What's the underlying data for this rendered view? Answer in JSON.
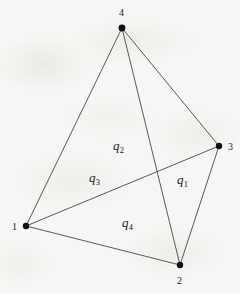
{
  "figure": {
    "kind": "graph-diagram",
    "width": 240,
    "height": 293,
    "background_color": "#f6f6f4",
    "line_color": "#3c3c3c",
    "node_color": "#101010",
    "text_color": "#1b1b1b"
  },
  "nodes": [
    {
      "id": "1",
      "label": "1",
      "x": 26,
      "y": 226,
      "r": 3.2,
      "label_x": 12,
      "label_y": 222
    },
    {
      "id": "2",
      "label": "2",
      "x": 180,
      "y": 265,
      "r": 3.2,
      "label_x": 177,
      "label_y": 276
    },
    {
      "id": "3",
      "label": "3",
      "x": 219,
      "y": 146,
      "r": 3.2,
      "label_x": 228,
      "label_y": 142
    },
    {
      "id": "4",
      "label": "4",
      "x": 122,
      "y": 28,
      "r": 3.4,
      "label_x": 119,
      "label_y": 8
    }
  ],
  "edges": [
    {
      "id": "e-1-4",
      "from": "1",
      "to": "4"
    },
    {
      "id": "e-1-3",
      "from": "1",
      "to": "3"
    },
    {
      "id": "e-1-2",
      "from": "1",
      "to": "2"
    },
    {
      "id": "e-4-3",
      "from": "4",
      "to": "3"
    },
    {
      "id": "e-4-2",
      "from": "4",
      "to": "2"
    },
    {
      "id": "e-3-2",
      "from": "3",
      "to": "2"
    }
  ],
  "region_labels": [
    {
      "id": "q1",
      "base": "q",
      "sub": "1",
      "x": 177,
      "y": 173
    },
    {
      "id": "q2",
      "base": "q",
      "sub": "2",
      "x": 113,
      "y": 139
    },
    {
      "id": "q3",
      "base": "q",
      "sub": "3",
      "x": 89,
      "y": 171
    },
    {
      "id": "q4",
      "base": "q",
      "sub": "4",
      "x": 122,
      "y": 216
    }
  ]
}
